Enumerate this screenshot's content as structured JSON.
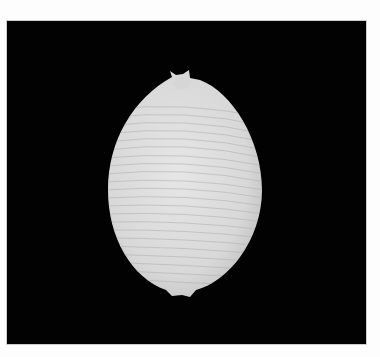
{
  "image": {
    "subject": "white ribbed cowrie-like seashell (dorsal view) on black background",
    "background_color": "#020202",
    "frame_color": "#fdfdfd",
    "shell_color": "#e4e4e4",
    "rib_color": "#b8b8b8"
  }
}
